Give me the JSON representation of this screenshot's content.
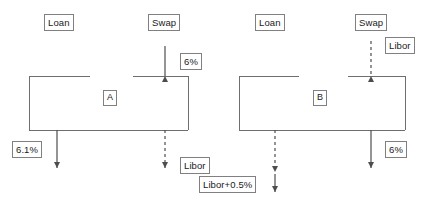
{
  "diagram": {
    "stroke_color": "#6e6e6e",
    "text_color": "#1a1a1a",
    "background": "#ffffff",
    "left": {
      "party_label": "A",
      "loan_label": "Loan",
      "swap_label": "Swap",
      "swap_up_rate": "6%",
      "loan_down_rate": "6.1%",
      "swap_down_rate": "Libor"
    },
    "right": {
      "party_label": "B",
      "loan_label": "Loan",
      "swap_label": "Swap",
      "swap_up_rate": "Libor",
      "loan_down_rate": "Libor+0.5%",
      "swap_down_rate": "6%"
    }
  }
}
